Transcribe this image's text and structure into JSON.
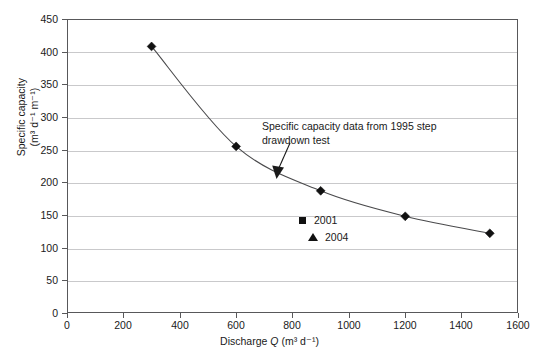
{
  "chart_data": {
    "type": "line",
    "title": "",
    "xlabel": "Discharge Q (m³ d⁻¹)",
    "ylabel": "Specific capacity (m³ d⁻¹ m⁻¹)",
    "ylabel_line1": "Specific capacity",
    "ylabel_line2": "(m³ d⁻¹ m⁻¹)",
    "xlim": [
      0,
      1600
    ],
    "ylim": [
      0,
      450
    ],
    "xticks": [
      0,
      200,
      400,
      600,
      800,
      1000,
      1200,
      1400,
      1600
    ],
    "yticks": [
      0,
      50,
      100,
      150,
      200,
      250,
      300,
      350,
      400,
      450
    ],
    "grid": "horizontal",
    "legend_position": "inside-center",
    "series": [
      {
        "name": "Specific capacity curve",
        "marker": "diamond",
        "color": "#111111",
        "x": [
          300,
          600,
          900,
          1200,
          1500
        ],
        "y": [
          408,
          255,
          187,
          148,
          122
        ]
      }
    ],
    "legend": [
      {
        "label": "2001",
        "marker": "square"
      },
      {
        "label": "2004",
        "marker": "triangle"
      }
    ],
    "annotations": [
      {
        "text_line1": "Specific capacity data from 1995 step",
        "text_line2": "drawdown test",
        "arrow_from": [
          835,
          218
        ],
        "arrow_to": [
          780,
          180
        ]
      }
    ]
  },
  "axis": {
    "x_tick_labels": [
      "0",
      "200",
      "400",
      "600",
      "800",
      "1000",
      "1200",
      "1400",
      "1600"
    ],
    "y_tick_labels": [
      "0",
      "50",
      "100",
      "150",
      "200",
      "250",
      "300",
      "350",
      "400",
      "450"
    ],
    "x_title_prefix": "Discharge ",
    "x_title_var": "Q",
    "x_title_units": " (m³ d⁻¹)"
  },
  "colors": {
    "frame": "#58585a",
    "gridline": "#c9c9cb",
    "curve": "#4a4a4c",
    "marker": "#111111",
    "text": "#1a1a1a",
    "background": "#ffffff"
  }
}
